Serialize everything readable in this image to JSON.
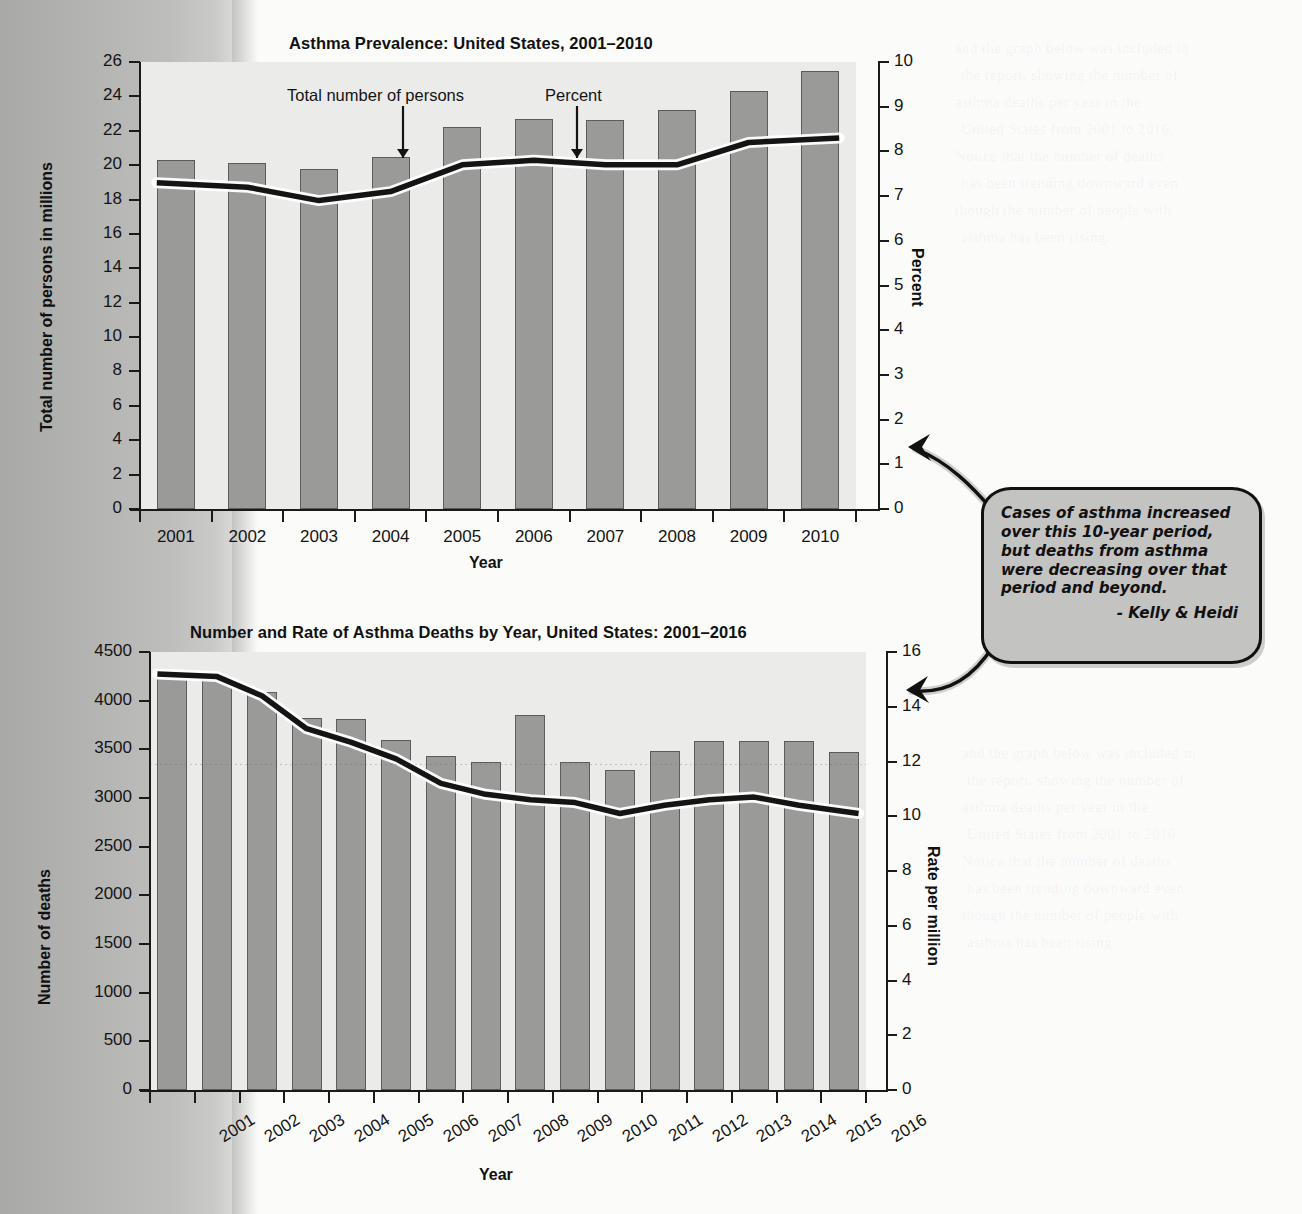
{
  "page": {
    "background_color": "#f4f4f2",
    "gutter_color": "#b0b0ae",
    "bar_color": "#9a9a98",
    "plot_bg_color": "#ebebe9",
    "line_color": "#141414"
  },
  "ghost_text": [
    "and the graph below was included in",
    "the report, showing the number of",
    "asthma deaths per year in the",
    "United States from 2001 to 2016.",
    "Notice that the number of deaths",
    "has been trending downward even",
    "though the number of people with",
    "asthma has been rising."
  ],
  "chart_data": [
    {
      "type": "bar",
      "id": "asthma-prevalence",
      "title": "Asthma Prevalence: United States, 2001–2010",
      "xlabel": "Year",
      "ylabel": "Total number of persons in millions",
      "y2label": "Percent",
      "categories": [
        "2001",
        "2002",
        "2003",
        "2004",
        "2005",
        "2006",
        "2007",
        "2008",
        "2009",
        "2010"
      ],
      "ylim": [
        0,
        26
      ],
      "yticks": [
        0,
        2,
        4,
        6,
        8,
        10,
        12,
        14,
        16,
        18,
        20,
        22,
        24,
        26
      ],
      "y2lim": [
        0,
        10
      ],
      "y2ticks": [
        0,
        1,
        2,
        3,
        4,
        5,
        6,
        7,
        8,
        9,
        10
      ],
      "grid": false,
      "legend_position": "in-plot-annotations",
      "series": [
        {
          "name": "Total number of persons",
          "kind": "bar",
          "axis": "left",
          "unit": "millions",
          "values": [
            20.3,
            20.1,
            19.8,
            20.5,
            22.2,
            22.7,
            22.6,
            23.2,
            24.3,
            25.5
          ]
        },
        {
          "name": "Percent",
          "kind": "line",
          "axis": "right",
          "unit": "percent",
          "values": [
            7.3,
            7.2,
            6.9,
            7.1,
            7.7,
            7.8,
            7.7,
            7.7,
            8.2,
            8.3
          ]
        }
      ],
      "annotations": [
        {
          "text": "Total number of persons",
          "points_to": "2004"
        },
        {
          "text": "Percent",
          "points_to": "2006"
        }
      ]
    },
    {
      "type": "bar",
      "id": "asthma-deaths",
      "title": "Number and Rate of Asthma Deaths by Year, United States: 2001–2016",
      "xlabel": "Year",
      "ylabel": "Number of deaths",
      "y2label": "Rate per million",
      "categories": [
        "2001",
        "2002",
        "2003",
        "2004",
        "2005",
        "2006",
        "2007",
        "2008",
        "2009",
        "2010",
        "2011",
        "2012",
        "2013",
        "2014",
        "2015",
        "2016"
      ],
      "ylim": [
        0,
        4500
      ],
      "yticks": [
        0,
        500,
        1000,
        1500,
        2000,
        2500,
        3000,
        3500,
        4000,
        4500
      ],
      "y2lim": [
        0,
        16
      ],
      "y2ticks": [
        0,
        2,
        4,
        6,
        8,
        10,
        12,
        14,
        16
      ],
      "grid": false,
      "legend_position": "none",
      "series": [
        {
          "name": "Number of deaths",
          "kind": "bar",
          "axis": "left",
          "unit": "deaths",
          "values": [
            4270,
            4220,
            4090,
            3820,
            3810,
            3600,
            3430,
            3370,
            3850,
            3370,
            3290,
            3480,
            3590,
            3590,
            3590,
            3470
          ]
        },
        {
          "name": "Rate per million",
          "kind": "line",
          "axis": "right",
          "unit": "per million",
          "values": [
            15.2,
            15.1,
            14.4,
            13.2,
            12.7,
            12.1,
            11.2,
            10.8,
            10.6,
            10.5,
            10.1,
            10.4,
            10.6,
            10.7,
            10.4,
            10.1
          ]
        }
      ],
      "annotations": []
    }
  ],
  "callout": {
    "text": "Cases of asthma increased over this 10-year period, but deaths from asthma were decreasing over that period and beyond.",
    "signature": "- Kelly & Heidi",
    "fill_color": "#c3c3c1",
    "border_color": "#111111"
  }
}
